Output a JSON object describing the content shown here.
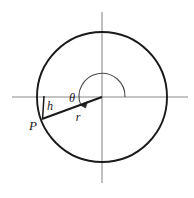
{
  "figure": {
    "background_color": "#ffffff",
    "stroke_color": "#1a1a1a",
    "axis_color": "#8a8a8a",
    "labels": {
      "radius": "r",
      "height": "h",
      "angle": "θ",
      "point": "P"
    },
    "geometry": {
      "origin_x": 102,
      "origin_y": 97,
      "circle_radius": 65,
      "arc_radius": 23,
      "point_p_x": 42,
      "point_p_y": 119,
      "h_line_x": 44,
      "x_axis_start": 12,
      "x_axis_end": 188,
      "y_axis_start": 12,
      "y_axis_end": 183
    },
    "label_positions": {
      "radius_x": 78,
      "radius_y": 118,
      "height_x": 50,
      "height_y": 107,
      "angle_x": 72,
      "angle_y": 99,
      "point_x": 33,
      "point_y": 127
    }
  }
}
